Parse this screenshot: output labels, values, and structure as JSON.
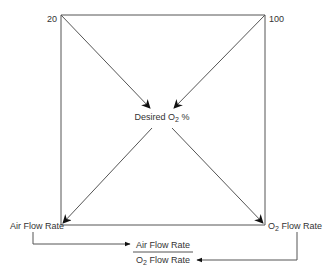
{
  "diagram": {
    "corner_labels": {
      "top_left": "20",
      "top_right": "100",
      "bottom_left": "Air Flow Rate",
      "bottom_right_prefix": "O",
      "bottom_right_sub": "2",
      "bottom_right_suffix": " Flow Rate"
    },
    "center_label": {
      "prefix": "Desired O",
      "sub": "2",
      "suffix": " %"
    },
    "fraction": {
      "numerator": "Air Flow Rate",
      "denominator_prefix": "O",
      "denominator_sub": "2",
      "denominator_suffix": " Flow Rate"
    },
    "colors": {
      "line": "#555555",
      "arrowhead": "#111111",
      "text": "#333333"
    }
  }
}
